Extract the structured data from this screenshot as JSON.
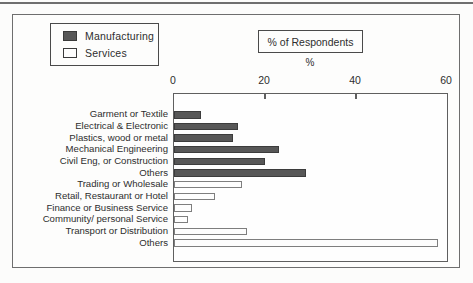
{
  "chart_data": {
    "type": "bar",
    "orientation": "horizontal",
    "title": "% of Respondents",
    "xlabel": "%",
    "xlim": [
      0,
      60
    ],
    "xticks": [
      0,
      20,
      40,
      60
    ],
    "grid": false,
    "legend_position": "top-left",
    "legend": [
      {
        "label": "Manufacturing",
        "color": "#575757"
      },
      {
        "label": "Services",
        "color": "#fdfdfd"
      }
    ],
    "bars": [
      {
        "category": "Garment or Textile",
        "group": "Manufacturing",
        "value": 6
      },
      {
        "category": "Electrical & Electronic",
        "group": "Manufacturing",
        "value": 14
      },
      {
        "category": "Plastics, wood or metal",
        "group": "Manufacturing",
        "value": 13
      },
      {
        "category": "Mechanical Engineering",
        "group": "Manufacturing",
        "value": 23
      },
      {
        "category": "Civil Eng, or Construction",
        "group": "Manufacturing",
        "value": 20
      },
      {
        "category": "Others",
        "group": "Manufacturing",
        "value": 29
      },
      {
        "category": "Trading or Wholesale",
        "group": "Services",
        "value": 15
      },
      {
        "category": "Retail, Restaurant or Hotel",
        "group": "Services",
        "value": 9
      },
      {
        "category": "Finance or Business Service",
        "group": "Services",
        "value": 4
      },
      {
        "category": "Community/ personal Service",
        "group": "Services",
        "value": 3
      },
      {
        "category": "Transport or Distribution",
        "group": "Services",
        "value": 16
      },
      {
        "category": "Others",
        "group": "Services",
        "value": 58
      }
    ]
  },
  "colors": {
    "manufacturing_fill": "#575757",
    "services_fill": "#fdfdfd",
    "frame_border": "#6e6e6e",
    "axis_border": "#5f5f5f"
  }
}
